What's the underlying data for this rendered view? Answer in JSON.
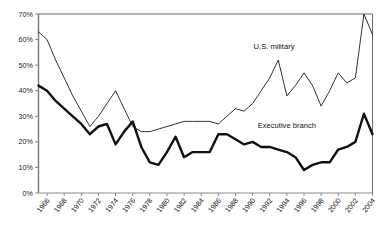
{
  "chart_data": {
    "type": "line",
    "title": "",
    "subtitle": "",
    "xlabel": "",
    "ylabel": "",
    "grid": false,
    "legend_position": "inline-annotation",
    "xlim": [
      1965,
      2004
    ],
    "ylim": [
      0,
      70
    ],
    "y_ticks": [
      0,
      10,
      20,
      30,
      40,
      50,
      60,
      70
    ],
    "y_tick_labels": [
      "0%",
      "10%",
      "20%",
      "30%",
      "40%",
      "50%",
      "60%",
      "70%"
    ],
    "x_ticks": [
      1966,
      1968,
      1970,
      1972,
      1974,
      1976,
      1978,
      1980,
      1982,
      1984,
      1986,
      1988,
      1990,
      1992,
      1994,
      1996,
      1998,
      2000,
      2002,
      2004
    ],
    "x_tick_labels": [
      "1966",
      "1968",
      "1970",
      "1972",
      "1974",
      "1976",
      "1978",
      "1980",
      "1982",
      "1984",
      "1986",
      "1988",
      "1990",
      "1992",
      "1994",
      "1996",
      "1998",
      "2000",
      "2002",
      "2004"
    ],
    "x": [
      1965,
      1966,
      1967,
      1968,
      1969,
      1970,
      1971,
      1972,
      1973,
      1974,
      1975,
      1976,
      1977,
      1978,
      1979,
      1980,
      1981,
      1982,
      1983,
      1984,
      1985,
      1986,
      1987,
      1988,
      1989,
      1990,
      1991,
      1992,
      1993,
      1994,
      1995,
      1996,
      1997,
      1998,
      1999,
      2000,
      2001,
      2002,
      2003,
      2004
    ],
    "series": [
      {
        "name": "U.S. military",
        "color": "#1a1a1a",
        "line_width": 0.9,
        "style": "thin",
        "label_x": 1992.5,
        "label_y": 56.5,
        "values": [
          63,
          60,
          52,
          45,
          38,
          32,
          26,
          30,
          35,
          40,
          33,
          26,
          24,
          24,
          25,
          26,
          27,
          28,
          28,
          28,
          28,
          27,
          30,
          33,
          32,
          35,
          40,
          45,
          52,
          38,
          42,
          47,
          42,
          34,
          40,
          47,
          43,
          45,
          70,
          62
        ]
      },
      {
        "name": "Executive branch",
        "color": "#111111",
        "line_width": 2.4,
        "style": "thick",
        "label_x": 1994.0,
        "label_y": 25.5,
        "values": [
          42,
          40,
          36,
          33,
          30,
          27,
          23,
          26,
          27,
          19,
          24,
          28,
          18,
          12,
          11,
          16,
          22,
          14,
          16,
          16,
          16,
          23,
          23,
          21,
          19,
          20,
          18,
          18,
          17,
          16,
          14,
          9,
          11,
          12,
          12,
          17,
          18,
          20,
          31,
          23
        ]
      }
    ]
  },
  "axes": {
    "top_border_color": "#9a9a9a",
    "left_axis_color": "#7a7a7a",
    "right_border_color": "#6a6a6a",
    "bottom_axis_color": "#8a8a8a"
  }
}
